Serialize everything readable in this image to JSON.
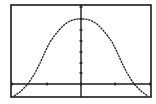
{
  "chart_data": {
    "type": "line",
    "title": "",
    "xlabel": "",
    "ylabel": "",
    "grid": false,
    "legend": "none",
    "xlim": [
      -1,
      1
    ],
    "ylim": [
      -0.15,
      1
    ],
    "x_ticks_px": [
      12,
      47,
      81,
      115,
      150
    ],
    "y_ticks_px": [
      7,
      19,
      30,
      41,
      52,
      63,
      73
    ],
    "series": [
      {
        "name": "Y1",
        "points_px": [
          [
            14,
            96
          ],
          [
            20,
            92
          ],
          [
            28,
            84
          ],
          [
            35,
            73
          ],
          [
            40,
            63
          ],
          [
            45,
            52
          ],
          [
            50,
            42
          ],
          [
            55,
            35
          ],
          [
            60,
            29
          ],
          [
            65,
            24
          ],
          [
            70,
            21
          ],
          [
            75,
            19.3
          ],
          [
            81,
            18.8
          ],
          [
            87,
            19.3
          ],
          [
            92,
            21
          ],
          [
            97,
            24
          ],
          [
            102,
            29
          ],
          [
            107,
            35
          ],
          [
            112,
            42
          ],
          [
            117,
            52
          ],
          [
            122,
            63
          ],
          [
            127,
            73
          ],
          [
            134,
            84
          ],
          [
            142,
            92
          ],
          [
            148,
            96
          ]
        ]
      }
    ]
  },
  "frame": {
    "left": 11,
    "top": 5,
    "right": 151,
    "bottom": 97
  },
  "axes": {
    "x_axis_y": 84,
    "y_axis_x": 81
  },
  "colors": {
    "background": "#ffffff",
    "ink": "#1a1a1a"
  }
}
